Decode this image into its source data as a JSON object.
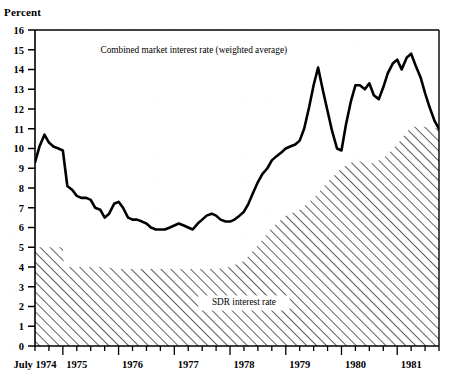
{
  "figure": {
    "y_axis_title": "Percent",
    "background_color": "#ffffff",
    "line_color": "#000000",
    "hatch_color": "#000000"
  },
  "chart_data": {
    "type": "line",
    "title": "",
    "subtitle": "",
    "xlabel": "",
    "ylabel": "Percent",
    "ylim": [
      0,
      16
    ],
    "xlim": [
      1974.5,
      1981.75
    ],
    "grid": false,
    "legend_position": "inline-annotation",
    "y_ticks": [
      0,
      1,
      2,
      3,
      4,
      5,
      6,
      7,
      8,
      9,
      10,
      11,
      12,
      13,
      14,
      15,
      16
    ],
    "y_tick_labels": [
      "0",
      "1",
      "2",
      "3",
      "4",
      "5",
      "6",
      "7",
      "8",
      "9",
      "10",
      "11",
      "12",
      "13",
      "14",
      "15",
      "16"
    ],
    "x_tick_labels": [
      "July 1974",
      "1975",
      "1976",
      "1977",
      "1978",
      "1979",
      "1980",
      "1981"
    ],
    "x_tick_values": [
      1974.5,
      1975.25,
      1976.25,
      1977.25,
      1978.25,
      1979.25,
      1980.25,
      1981.25
    ],
    "x_minor_tick_interval_months": 3,
    "annotations": [
      {
        "text": "Combined market interest rate (weighted average)",
        "x": 1977.35,
        "y": 14.85
      },
      {
        "text": "SDR interest rate",
        "x": 1978.25,
        "y": 2.1
      }
    ],
    "series": [
      {
        "name": "Combined market interest rate (weighted average)",
        "style": "solid-line",
        "x": [
          1974.5,
          1974.58,
          1974.67,
          1974.75,
          1974.83,
          1974.92,
          1975.0,
          1975.08,
          1975.17,
          1975.25,
          1975.33,
          1975.42,
          1975.5,
          1975.58,
          1975.67,
          1975.75,
          1975.83,
          1975.92,
          1976.0,
          1976.08,
          1976.17,
          1976.25,
          1976.33,
          1976.42,
          1976.5,
          1976.58,
          1976.67,
          1976.75,
          1976.83,
          1976.92,
          1977.0,
          1977.08,
          1977.17,
          1977.25,
          1977.33,
          1977.42,
          1977.5,
          1977.58,
          1977.67,
          1977.75,
          1977.83,
          1977.92,
          1978.0,
          1978.08,
          1978.17,
          1978.25,
          1978.33,
          1978.42,
          1978.5,
          1978.58,
          1978.67,
          1978.75,
          1978.83,
          1978.92,
          1979.0,
          1979.08,
          1979.17,
          1979.25,
          1979.33,
          1979.42,
          1979.5,
          1979.58,
          1979.67,
          1979.75,
          1979.83,
          1979.92,
          1980.0,
          1980.08,
          1980.17,
          1980.25,
          1980.33,
          1980.42,
          1980.5,
          1980.58,
          1980.67,
          1980.75,
          1980.83,
          1980.92,
          1981.0,
          1981.08,
          1981.17,
          1981.25,
          1981.33,
          1981.42,
          1981.5,
          1981.58,
          1981.67,
          1981.75
        ],
        "y": [
          9.3,
          10.1,
          10.7,
          10.3,
          10.1,
          10.0,
          9.9,
          8.1,
          7.9,
          7.6,
          7.5,
          7.5,
          7.4,
          7.0,
          6.9,
          6.5,
          6.7,
          7.2,
          7.3,
          7.0,
          6.5,
          6.4,
          6.4,
          6.3,
          6.2,
          6.0,
          5.9,
          5.9,
          5.9,
          6.0,
          6.1,
          6.2,
          6.1,
          6.0,
          5.9,
          6.2,
          6.4,
          6.6,
          6.7,
          6.6,
          6.4,
          6.3,
          6.3,
          6.4,
          6.6,
          6.8,
          7.2,
          7.8,
          8.3,
          8.7,
          9.0,
          9.4,
          9.6,
          9.8,
          10.0,
          10.1,
          10.2,
          10.4,
          11.0,
          12.1,
          13.2,
          14.1,
          12.9,
          11.9,
          10.9,
          10.0,
          9.9,
          11.2,
          12.4,
          13.2,
          13.2,
          13.0,
          13.3,
          12.7,
          12.5,
          13.1,
          13.8,
          14.3,
          14.5,
          14.0,
          14.6,
          14.8,
          14.2,
          13.6,
          12.8,
          12.1,
          11.4,
          11.0
        ]
      },
      {
        "name": "SDR interest rate",
        "style": "hatched-area",
        "x": [
          1974.5,
          1974.75,
          1975.0,
          1975.02,
          1975.25,
          1975.5,
          1975.75,
          1976.0,
          1976.25,
          1976.5,
          1976.75,
          1977.0,
          1977.25,
          1977.5,
          1977.75,
          1978.0,
          1978.25,
          1978.5,
          1978.75,
          1979.0,
          1979.25,
          1979.5,
          1979.75,
          1980.0,
          1980.25,
          1980.5,
          1980.75,
          1981.0,
          1981.25,
          1981.5,
          1981.75
        ],
        "y": [
          5.0,
          5.0,
          5.0,
          4.0,
          4.0,
          4.0,
          4.0,
          3.9,
          3.9,
          3.9,
          3.9,
          3.9,
          3.9,
          3.9,
          3.9,
          4.0,
          4.3,
          5.1,
          6.0,
          6.6,
          6.9,
          7.5,
          8.3,
          9.0,
          9.4,
          9.2,
          9.5,
          10.2,
          11.1,
          11.1,
          11.0
        ]
      }
    ]
  }
}
